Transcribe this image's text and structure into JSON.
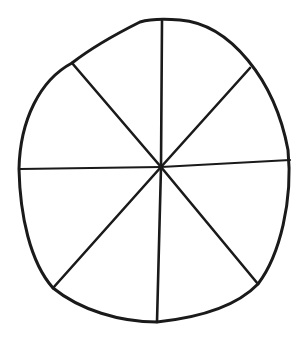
{
  "diagram": {
    "type": "hand-drawn circle divided into 8 segments",
    "segments": 8,
    "stroke_color": "#1a1a1a",
    "background_color": "#ffffff",
    "center": [
      161,
      167
    ],
    "outline_path": "M 140 22 C 150 19, 168 19, 180 20 C 230 24, 275 80, 288 150 C 293 200, 280 255, 258 284 C 235 308, 195 318, 157 322 C 120 322, 80 310, 53 288 C 30 262, 20 215, 19 169 C 20 120, 40 80, 72 63 C 95 45, 120 32, 140 22 Z",
    "spokes": [
      {
        "name": "spoke-top",
        "x1": 161,
        "y1": 167,
        "x2": 162,
        "y2": 21
      },
      {
        "name": "spoke-top-right",
        "x1": 161,
        "y1": 167,
        "x2": 250,
        "y2": 68
      },
      {
        "name": "spoke-right",
        "x1": 161,
        "y1": 167,
        "x2": 290,
        "y2": 160,
        "thin": true
      },
      {
        "name": "spoke-bottom-right",
        "x1": 161,
        "y1": 167,
        "x2": 258,
        "y2": 284
      },
      {
        "name": "spoke-bottom",
        "x1": 161,
        "y1": 167,
        "x2": 157,
        "y2": 322
      },
      {
        "name": "spoke-bottom-left",
        "x1": 161,
        "y1": 167,
        "x2": 53,
        "y2": 288
      },
      {
        "name": "spoke-left",
        "x1": 161,
        "y1": 167,
        "x2": 20,
        "y2": 169,
        "thin": true
      },
      {
        "name": "spoke-top-left",
        "x1": 161,
        "y1": 167,
        "x2": 72,
        "y2": 63
      }
    ]
  }
}
